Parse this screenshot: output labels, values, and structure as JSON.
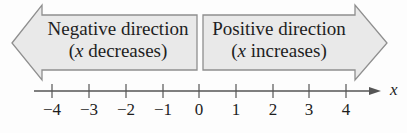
{
  "diagram": {
    "type": "number_line",
    "axis_label": "x",
    "ticks": [
      "−4",
      "−3",
      "−2",
      "−1",
      "0",
      "1",
      "2",
      "3",
      "4"
    ],
    "tick_x": [
      52,
      89,
      126,
      163,
      199,
      236,
      273,
      309,
      346
    ],
    "colors": {
      "arrow_fill": "#e9e9e9",
      "arrow_stroke": "#8f8f8f",
      "axis": "#555555",
      "text": "#1e1e1e"
    },
    "negative_arrow": {
      "line1": "Negative direction",
      "line2_var": "x",
      "line2_rest": " decreases)",
      "line2_open": "("
    },
    "positive_arrow": {
      "line1": "Positive direction",
      "line2_var": "x",
      "line2_rest": " increases)",
      "line2_open": "("
    }
  }
}
